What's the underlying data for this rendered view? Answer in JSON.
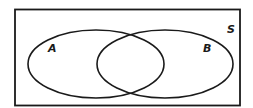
{
  "diagram": {
    "type": "venn",
    "universal_set_label": "S",
    "sets": [
      {
        "label": "A"
      },
      {
        "label": "B"
      }
    ],
    "stroke_color": "#1a1a1a",
    "background_color": "#ffffff"
  }
}
